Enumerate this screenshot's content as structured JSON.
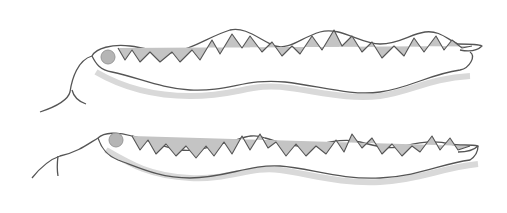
{
  "image": {
    "description": "Pencil drawing of two snakes with zigzag dorsal pattern",
    "subjects": [
      {
        "name": "snake-top",
        "orientation": "head-left",
        "pattern": "zigzag triangles"
      },
      {
        "name": "snake-bottom",
        "orientation": "head-left",
        "pattern": "zigzag triangles"
      }
    ],
    "colors": {
      "background": "#ffffff",
      "outline": "#555555",
      "pattern_fill": "#bdbdbd",
      "shadow": "#d9d9d9",
      "eye": "#9a9a9a"
    }
  }
}
